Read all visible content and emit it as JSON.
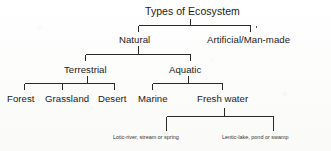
{
  "diagram": {
    "title": "Types of Ecosystem",
    "type": "hierarchy-tree",
    "ink_color": "#2a2a2a",
    "paper_color": "#fdfdfc",
    "levels": [
      {
        "level": 1,
        "nodes": [
          {
            "id": "root",
            "label": "Types of Ecosystem"
          }
        ]
      },
      {
        "level": 2,
        "nodes": [
          {
            "id": "natural",
            "label": "Natural"
          },
          {
            "id": "artificial",
            "label": "Artificial/Man-made"
          }
        ]
      },
      {
        "level": 3,
        "nodes": [
          {
            "id": "terrestrial",
            "label": "Terrestrial"
          },
          {
            "id": "aquatic",
            "label": "Aquatic"
          }
        ]
      },
      {
        "level": 4,
        "nodes": [
          {
            "id": "forest",
            "label": "Forest"
          },
          {
            "id": "grassland",
            "label": "Grassland"
          },
          {
            "id": "desert",
            "label": "Desert"
          },
          {
            "id": "marine",
            "label": "Marine"
          },
          {
            "id": "freshwater",
            "label": "Fresh water"
          }
        ]
      },
      {
        "level": 5,
        "nodes": [
          {
            "id": "lotic",
            "label": "Lotic-river, stream or spring"
          },
          {
            "id": "lentic",
            "label": "Lentic-lake, pond or swamp"
          }
        ]
      }
    ]
  }
}
